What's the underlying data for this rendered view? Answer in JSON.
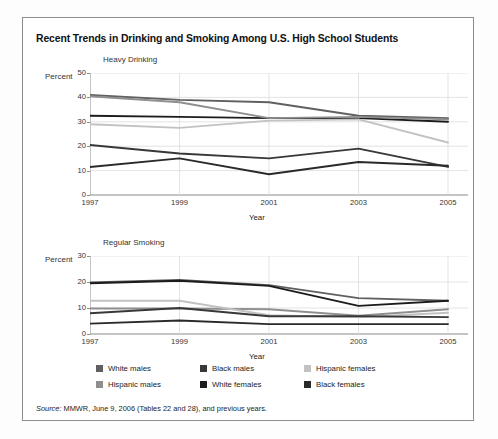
{
  "title": "Recent Trends in Drinking and Smoking Among U.S. High School Students",
  "source": {
    "prefix": "Source:",
    "text": " MMWR, June 9, 2006 (Tables 22 and 28), and previous years."
  },
  "legend": {
    "items": [
      {
        "label": "White males",
        "color": "#606060"
      },
      {
        "label": "Hispanic males",
        "color": "#8f8f8f"
      },
      {
        "label": "Black males",
        "color": "#383838"
      },
      {
        "label": "White females",
        "color": "#1c1c1c"
      },
      {
        "label": "Hispanic females",
        "color": "#c2c2c2"
      },
      {
        "label": "Black females",
        "color": "#2a2a2a"
      }
    ]
  },
  "chart_data": [
    {
      "type": "line",
      "title": "Heavy Drinking",
      "xlabel": "Year",
      "ylabel": "Percent",
      "x": [
        1997,
        1999,
        2001,
        2003,
        2005
      ],
      "xticks": [
        "1997",
        "1999",
        "2001",
        "2003",
        "2005"
      ],
      "yticks": [
        0,
        10,
        20,
        30,
        40,
        50
      ],
      "ylim": [
        0,
        50
      ],
      "xlim": [
        1997,
        2005
      ],
      "grid": true,
      "legend_position": "below-figure",
      "series": [
        {
          "name": "White males",
          "color": "#606060",
          "values": [
            41.0,
            39.0,
            38.0,
            32.5,
            31.5
          ]
        },
        {
          "name": "White females",
          "color": "#1c1c1c",
          "values": [
            32.5,
            32.0,
            31.5,
            31.5,
            30.0
          ]
        },
        {
          "name": "Hispanic males",
          "color": "#8f8f8f",
          "values": [
            40.5,
            38.0,
            31.5,
            32.0,
            31.0
          ]
        },
        {
          "name": "Hispanic females",
          "color": "#c2c2c2",
          "values": [
            29.0,
            27.5,
            30.5,
            31.0,
            21.5
          ]
        },
        {
          "name": "Black males",
          "color": "#383838",
          "values": [
            20.5,
            17.0,
            15.0,
            19.0,
            11.5
          ]
        },
        {
          "name": "Black females",
          "color": "#2a2a2a",
          "values": [
            11.5,
            15.0,
            8.5,
            13.5,
            12.0
          ]
        }
      ]
    },
    {
      "type": "line",
      "title": "Regular Smoking",
      "xlabel": "Year",
      "ylabel": "Percent",
      "x": [
        1997,
        1999,
        2001,
        2003,
        2005
      ],
      "xticks": [
        "1997",
        "1999",
        "2001",
        "2003",
        "2005"
      ],
      "yticks": [
        0,
        10,
        20,
        30
      ],
      "ylim": [
        0,
        30
      ],
      "xlim": [
        1997,
        2005
      ],
      "grid": true,
      "legend_position": "below-figure",
      "series": [
        {
          "name": "White males",
          "color": "#606060",
          "values": [
            19.8,
            20.8,
            18.8,
            13.8,
            12.8
          ]
        },
        {
          "name": "White females",
          "color": "#1c1c1c",
          "values": [
            19.5,
            20.5,
            18.5,
            10.8,
            12.8
          ]
        },
        {
          "name": "Hispanic males",
          "color": "#8f8f8f",
          "values": [
            9.8,
            9.8,
            9.5,
            7.0,
            9.5
          ]
        },
        {
          "name": "Hispanic females",
          "color": "#c2c2c2",
          "values": [
            12.8,
            12.8,
            7.2,
            6.5,
            8.2
          ]
        },
        {
          "name": "Black males",
          "color": "#383838",
          "values": [
            8.0,
            10.0,
            6.8,
            6.8,
            6.5
          ]
        },
        {
          "name": "Black females",
          "color": "#2a2a2a",
          "values": [
            4.0,
            5.2,
            3.8,
            3.8,
            3.8
          ]
        }
      ]
    }
  ]
}
